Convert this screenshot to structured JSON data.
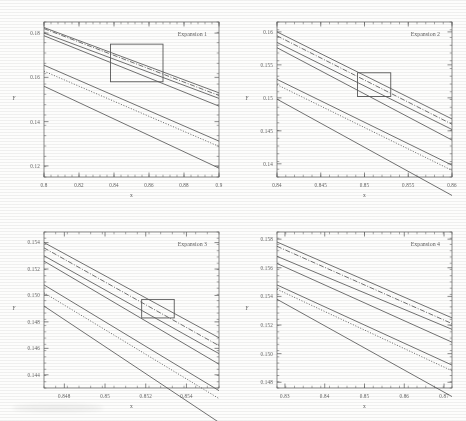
{
  "figure": {
    "caption": "Four-panel figure of expansion curves",
    "panel_count": 4,
    "ink_color": "#33332f",
    "background_color": "#fdfdfc"
  },
  "chart_data": [
    {
      "type": "line",
      "title": "Expansion 1",
      "xlabel": "x",
      "ylabel": "F",
      "xlim": [
        0.8,
        0.9
      ],
      "ylim": [
        0.115,
        0.185
      ],
      "xticks": [
        "0.8",
        "0.82",
        "0.84",
        "0.86",
        "0.88",
        "0.9"
      ],
      "xtick_values": [
        0.8,
        0.82,
        0.84,
        0.86,
        0.88,
        0.9
      ],
      "yticks": [
        "0.18",
        "0.16",
        "0.14",
        "0.12"
      ],
      "ytick_values": [
        0.18,
        0.16,
        0.14,
        0.12
      ],
      "grid": false,
      "legend": "none",
      "inset_box": {
        "x0": 0.838,
        "x1": 0.868,
        "y0": 0.158,
        "y1": 0.175
      },
      "series": [
        {
          "name": "curve-1",
          "style": "solid",
          "x": [
            0.8,
            0.9
          ],
          "values": [
            0.1825,
            0.153
          ]
        },
        {
          "name": "curve-2",
          "style": "dash-dot",
          "x": [
            0.8,
            0.9
          ],
          "values": [
            0.182,
            0.1518
          ]
        },
        {
          "name": "curve-3",
          "style": "solid",
          "x": [
            0.8,
            0.9
          ],
          "values": [
            0.18,
            0.1505
          ]
        },
        {
          "name": "curve-4",
          "style": "solid",
          "x": [
            0.8,
            0.9
          ],
          "values": [
            0.1788,
            0.147
          ]
        },
        {
          "name": "curve-5",
          "style": "solid",
          "x": [
            0.8,
            0.9
          ],
          "values": [
            0.1655,
            0.1312
          ]
        },
        {
          "name": "curve-6",
          "style": "dotted",
          "x": [
            0.8,
            0.9
          ],
          "values": [
            0.1628,
            0.1288
          ]
        },
        {
          "name": "curve-7",
          "style": "solid",
          "x": [
            0.8,
            0.9
          ],
          "values": [
            0.156,
            0.119
          ]
        }
      ]
    },
    {
      "type": "line",
      "title": "Expansion 2",
      "xlabel": "x",
      "ylabel": "F",
      "xlim": [
        0.84,
        0.86
      ],
      "ylim": [
        0.138,
        0.1615
      ],
      "xticks": [
        "0.84",
        "0.845",
        "0.85",
        "0.855",
        "0.86"
      ],
      "xtick_values": [
        0.84,
        0.845,
        0.85,
        0.855,
        0.86
      ],
      "yticks": [
        "0.16",
        "0.155",
        "0.15",
        "0.145",
        "0.14"
      ],
      "ytick_values": [
        0.16,
        0.155,
        0.15,
        0.145,
        0.14
      ],
      "grid": false,
      "legend": "none",
      "inset_box": {
        "x0": 0.8492,
        "x1": 0.853,
        "y0": 0.1502,
        "y1": 0.1538
      },
      "series": [
        {
          "name": "curve-1",
          "style": "solid",
          "x": [
            0.84,
            0.86
          ],
          "values": [
            0.16,
            0.1468
          ]
        },
        {
          "name": "curve-2",
          "style": "dash-dot",
          "x": [
            0.84,
            0.86
          ],
          "values": [
            0.1594,
            0.146
          ]
        },
        {
          "name": "curve-3",
          "style": "solid",
          "x": [
            0.84,
            0.86
          ],
          "values": [
            0.1584,
            0.1452
          ]
        },
        {
          "name": "curve-4",
          "style": "solid",
          "x": [
            0.84,
            0.86
          ],
          "values": [
            0.1576,
            0.1436
          ]
        },
        {
          "name": "curve-5",
          "style": "solid",
          "x": [
            0.84,
            0.86
          ],
          "values": [
            0.1528,
            0.1398
          ]
        },
        {
          "name": "curve-6",
          "style": "dotted",
          "x": [
            0.84,
            0.86
          ],
          "values": [
            0.152,
            0.139
          ]
        },
        {
          "name": "curve-7",
          "style": "solid",
          "x": [
            0.84,
            0.86
          ],
          "values": [
            0.1498,
            0.1352
          ]
        }
      ]
    },
    {
      "type": "line",
      "title": "Expansion 3",
      "xlabel": "x",
      "ylabel": "F",
      "xlim": [
        0.847,
        0.8556
      ],
      "ylim": [
        0.143,
        0.1548
      ],
      "xticks": [
        "0.848",
        "0.85",
        "0.852",
        "0.854"
      ],
      "xtick_values": [
        0.848,
        0.85,
        0.852,
        0.854
      ],
      "yticks": [
        "0.154",
        "0.152",
        "0.150",
        "0.148",
        "0.146",
        "0.144"
      ],
      "ytick_values": [
        0.154,
        0.152,
        0.15,
        0.148,
        0.146,
        0.144
      ],
      "grid": false,
      "legend": "none",
      "inset_box": {
        "x0": 0.8518,
        "x1": 0.8534,
        "y0": 0.1483,
        "y1": 0.1497
      },
      "series": [
        {
          "name": "curve-1",
          "style": "solid",
          "x": [
            0.847,
            0.8556
          ],
          "values": [
            0.154,
            0.1468
          ]
        },
        {
          "name": "curve-2",
          "style": "dash-dot",
          "x": [
            0.847,
            0.8556
          ],
          "values": [
            0.1536,
            0.1462
          ]
        },
        {
          "name": "curve-3",
          "style": "solid",
          "x": [
            0.847,
            0.8556
          ],
          "values": [
            0.153,
            0.1456
          ]
        },
        {
          "name": "curve-4",
          "style": "solid",
          "x": [
            0.847,
            0.8556
          ],
          "values": [
            0.1526,
            0.1448
          ]
        },
        {
          "name": "curve-5",
          "style": "solid",
          "x": [
            0.847,
            0.8556
          ],
          "values": [
            0.1508,
            0.1428
          ]
        },
        {
          "name": "curve-6",
          "style": "dotted",
          "x": [
            0.847,
            0.8556
          ],
          "values": [
            0.1502,
            0.1422
          ]
        },
        {
          "name": "curve-7",
          "style": "solid",
          "x": [
            0.847,
            0.8556
          ],
          "values": [
            0.1492,
            0.1404
          ]
        }
      ]
    },
    {
      "type": "line",
      "title": "Expansion 4",
      "xlabel": "x",
      "ylabel": "F",
      "xlim": [
        0.828,
        0.872
      ],
      "ylim": [
        0.1476,
        0.1585
      ],
      "xticks": [
        "0.83",
        "0.84",
        "0.85",
        "0.86",
        "0.87"
      ],
      "xtick_values": [
        0.83,
        0.84,
        0.85,
        0.86,
        0.87
      ],
      "yticks": [
        "0.158",
        "0.156",
        "0.154",
        "0.152",
        "0.150",
        "0.148"
      ],
      "ytick_values": [
        0.158,
        0.156,
        0.154,
        0.152,
        0.15,
        0.148
      ],
      "grid": false,
      "legend": "none",
      "inset_box": null,
      "series": [
        {
          "name": "curve-1",
          "style": "solid",
          "x": [
            0.828,
            0.872
          ],
          "values": [
            0.1578,
            0.1525
          ]
        },
        {
          "name": "curve-2",
          "style": "dash-dot",
          "x": [
            0.828,
            0.872
          ],
          "values": [
            0.1575,
            0.1521
          ]
        },
        {
          "name": "curve-3",
          "style": "solid",
          "x": [
            0.828,
            0.872
          ],
          "values": [
            0.1568,
            0.1517
          ]
        },
        {
          "name": "curve-4",
          "style": "solid",
          "x": [
            0.828,
            0.872
          ],
          "values": [
            0.1563,
            0.1508
          ]
        },
        {
          "name": "curve-5",
          "style": "solid",
          "x": [
            0.828,
            0.872
          ],
          "values": [
            0.1548,
            0.1492
          ]
        },
        {
          "name": "curve-6",
          "style": "dotted",
          "x": [
            0.828,
            0.872
          ],
          "values": [
            0.1545,
            0.1488
          ]
        },
        {
          "name": "curve-7",
          "style": "solid",
          "x": [
            0.828,
            0.872
          ],
          "values": [
            0.1538,
            0.147
          ]
        }
      ]
    }
  ]
}
